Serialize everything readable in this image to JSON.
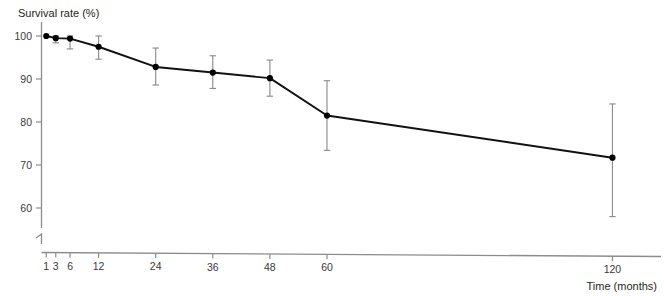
{
  "chart_data": {
    "type": "line",
    "title": "",
    "ylabel": "Survival rate (%)",
    "xlabel": "Time (months)",
    "x": [
      1,
      3,
      6,
      12,
      24,
      36,
      48,
      60,
      120
    ],
    "xtick_labels": [
      "1",
      "3",
      "6",
      "12",
      "24",
      "36",
      "48",
      "60",
      "120"
    ],
    "ytick_labels": [
      "60",
      "70",
      "80",
      "90",
      "100"
    ],
    "yticks": [
      60,
      70,
      80,
      90,
      100
    ],
    "ylim": [
      60,
      100
    ],
    "xlim": [
      0,
      126
    ],
    "axis_break": true,
    "grid": false,
    "legend": "none",
    "series": [
      {
        "name": "Survival rate",
        "values": [
          100.0,
          99.5,
          99.4,
          97.5,
          92.8,
          91.5,
          90.2,
          81.5,
          71.7
        ],
        "error_low": [
          100.0,
          98.4,
          97.0,
          94.6,
          88.6,
          87.8,
          86.0,
          73.4,
          58.0
        ],
        "error_high": [
          100.0,
          100.0,
          100.0,
          100.0,
          97.2,
          95.4,
          94.4,
          89.6,
          84.2
        ],
        "marker": "filled-circle",
        "line_color": "#111111",
        "error_color": "#8d8d8d"
      }
    ]
  },
  "axes": {
    "y_axis_label": "Survival rate (%)",
    "x_axis_label": "Time (months)"
  },
  "footer": {
    "note": ""
  }
}
